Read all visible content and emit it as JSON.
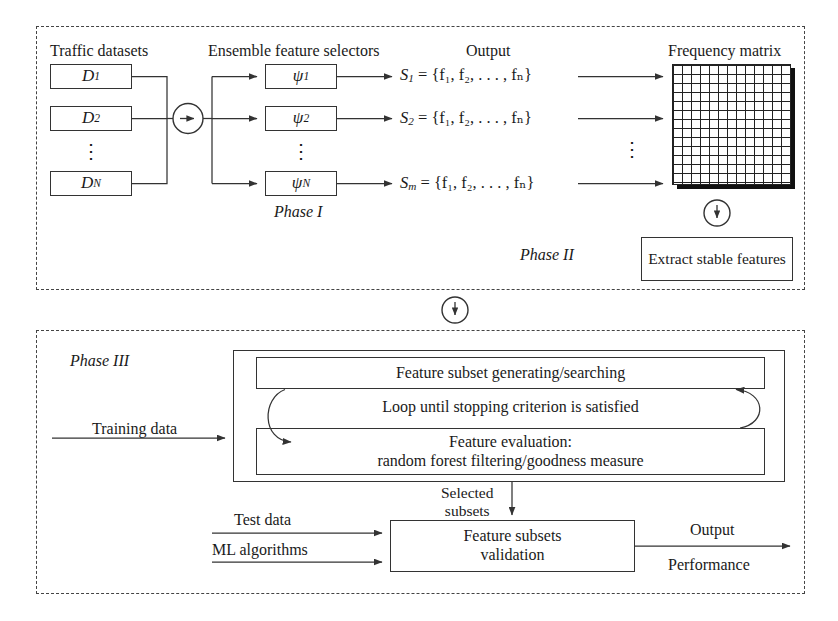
{
  "phase1": {
    "label": "Phase I",
    "datasets_header": "Traffic datasets",
    "selectors_header": "Ensemble feature selectors",
    "output_header": "Output",
    "datasets": [
      {
        "name": "D",
        "sub": "1"
      },
      {
        "name": "D",
        "sub": "2"
      },
      {
        "name": "D",
        "sub": "N"
      }
    ],
    "dataset_vdots": "⋮",
    "selectors": [
      {
        "name": "ψ",
        "sub": "1"
      },
      {
        "name": "ψ",
        "sub": "2"
      },
      {
        "name": "ψ",
        "sub": "N"
      }
    ],
    "selector_vdots": "⋮",
    "outputs": [
      {
        "set": "S",
        "sub": "1",
        "body": " = {f₁, f₂, . . . , fₙ}"
      },
      {
        "set": "S",
        "sub": "2",
        "body": " = {f₁, f₂, . . . , fₙ}"
      },
      {
        "set": "S",
        "sub": "m",
        "body": " = {f₁, f₂, . . . , fₙ}"
      }
    ],
    "dataset_bus_arrow": "right-arrow-circle"
  },
  "phase2": {
    "label": "Phase II",
    "matrix_header": "Frequency matrix",
    "matrix_vdots": "⋮",
    "extract_box": "Extract stable features",
    "down_arrow": "down-arrow-circle"
  },
  "transition": {
    "down_arrow": "down-arrow-circle"
  },
  "phase3": {
    "label": "Phase III",
    "training_data": "Training data",
    "search_box": "Feature subset generating/searching",
    "loop_text": "Loop until stopping criterion is satisfied",
    "evaluation_box_line1": "Feature evaluation:",
    "evaluation_box_line2": "random forest filtering/goodness measure",
    "selected_subsets_line1": "Selected",
    "selected_subsets_line2": "subsets",
    "test_data": "Test data",
    "ml_algorithms": "ML algorithms",
    "validation_box_line1": "Feature subsets",
    "validation_box_line2": "validation",
    "output_line1": "Output",
    "output_line2": "Performance"
  },
  "colors": {
    "stroke": "#333333",
    "dashed_border": "#444444",
    "background": "#ffffff",
    "matrix_shadow": "#111111"
  }
}
